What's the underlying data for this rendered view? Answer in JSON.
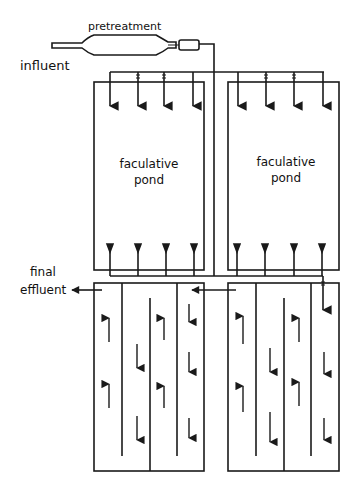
{
  "diagram": {
    "type": "waste stabilization pond flow schematic",
    "labels": {
      "pretreatment": "pretreatment",
      "influent": "influent",
      "facultative_left_line1": "faculative",
      "facultative_left_line2": "pond",
      "facultative_right_line1": "faculative",
      "facultative_right_line2": "pond",
      "final_line1": "final",
      "final_line2": "effluent"
    },
    "components": [
      {
        "id": "pretreatment-unit",
        "label": "pretreatment"
      },
      {
        "id": "facultative-pond-1",
        "label": "faculative pond",
        "inlets": 4,
        "outlets": 4
      },
      {
        "id": "facultative-pond-2",
        "label": "faculative pond",
        "inlets": 4,
        "outlets": 4
      },
      {
        "id": "maturation-pond-1",
        "label": "",
        "baffled_channels": 4
      },
      {
        "id": "maturation-pond-2",
        "label": "",
        "baffled_channels": 4
      }
    ],
    "flow": [
      "influent",
      "pretreatment",
      "facultative ponds (parallel)",
      "maturation ponds (series)",
      "final effluent"
    ],
    "stroke_color": "#1a1a1a",
    "background": "#ffffff"
  }
}
